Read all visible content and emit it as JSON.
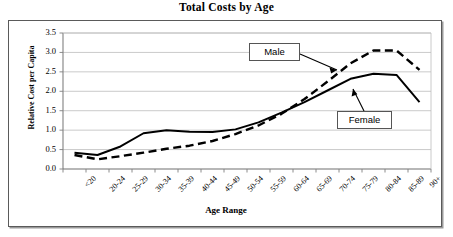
{
  "chart_data": {
    "type": "line",
    "title": "Total Costs by Age",
    "xlabel": "Age Range",
    "ylabel": "Relative Cost per Capita",
    "categories": [
      "<20",
      "20-24",
      "25-29",
      "30-34",
      "35-39",
      "40-44",
      "45-49",
      "50-54",
      "55-59",
      "60-64",
      "65-69",
      "70-74",
      "75-79",
      "80-84",
      "85-89",
      "90+"
    ],
    "series": [
      {
        "name": "Male",
        "style": "dashed",
        "color": "#000000",
        "values": [
          0.36,
          0.25,
          0.33,
          0.42,
          0.52,
          0.6,
          0.72,
          0.9,
          1.12,
          1.42,
          1.8,
          2.25,
          2.72,
          3.05,
          3.05,
          2.55
        ]
      },
      {
        "name": "Female",
        "style": "solid",
        "color": "#000000",
        "values": [
          0.42,
          0.36,
          0.58,
          0.92,
          1.0,
          0.96,
          0.95,
          1.02,
          1.2,
          1.45,
          1.72,
          2.02,
          2.32,
          2.45,
          2.42,
          1.72
        ]
      }
    ],
    "ylim": [
      0.0,
      3.5
    ],
    "yticks": [
      "0.0",
      "0.5",
      "1.0",
      "1.5",
      "2.0",
      "2.5",
      "3.0",
      "3.5"
    ],
    "ytick_values": [
      0.0,
      0.5,
      1.0,
      1.5,
      2.0,
      2.5,
      3.0,
      3.5
    ],
    "grid": true,
    "grid_axis": "y",
    "legend_position": "annotations",
    "annotations": [
      {
        "label": "Male",
        "points_to_series": "Male"
      },
      {
        "label": "Female",
        "points_to_series": "Female"
      }
    ]
  }
}
